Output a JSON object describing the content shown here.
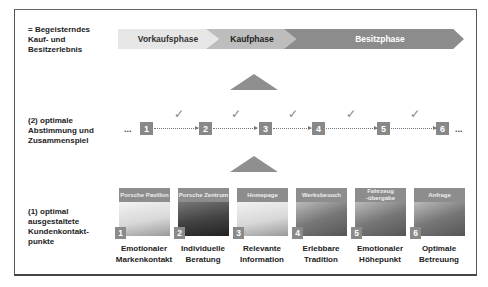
{
  "rows": {
    "top_label": [
      "= Begeisterndes",
      "Kauf- und",
      "Besitzerlebnis"
    ],
    "middle_label": [
      "(2) optimale",
      "Abstimmung und",
      "Zusammenspiel"
    ],
    "bottom_label": [
      "(1) optimal",
      "ausgestaltete",
      "Kundenkontakt-",
      "punkte"
    ]
  },
  "phases": [
    {
      "label": "Vorkaufsphase",
      "color": "#e6e6e6"
    },
    {
      "label": "Kaufphase",
      "color": "#bdbdbd"
    },
    {
      "label": "Besitzphase",
      "color": "#8c8c8c"
    }
  ],
  "sequence": {
    "leading": "...",
    "trailing": "...",
    "steps": [
      "1",
      "2",
      "3",
      "4",
      "5",
      "6"
    ],
    "check_glyph": "✓"
  },
  "touchpoints": [
    {
      "num": "1",
      "title": "Porsche Pavillon",
      "caption": [
        "Emotionaler",
        "Markenkontakt"
      ]
    },
    {
      "num": "2",
      "title": "Porsche Zentrum",
      "caption": [
        "Individuelle",
        "Beratung"
      ]
    },
    {
      "num": "3",
      "title": "Homepage",
      "caption": [
        "Relevante",
        "Information"
      ]
    },
    {
      "num": "4",
      "title": "Werksbesuch",
      "caption": [
        "Erlebbare",
        "Tradition"
      ]
    },
    {
      "num": "5",
      "title": "Fahrzeug -übergabe",
      "caption": [
        "Emotionaler",
        "Höhepunkt"
      ]
    },
    {
      "num": "6",
      "title": "Anfrage",
      "caption": [
        "Optimale",
        "Betreuung"
      ]
    }
  ]
}
